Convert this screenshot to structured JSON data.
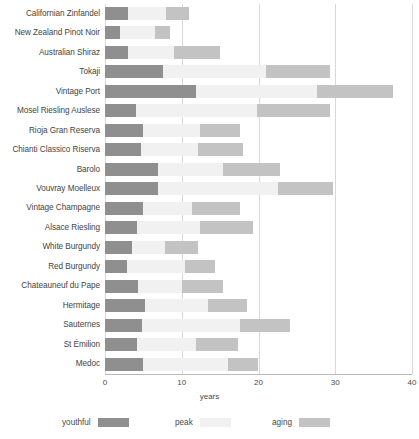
{
  "chart_data": {
    "type": "bar",
    "subtype": "stacked-horizontal",
    "title": "",
    "xlabel": "years",
    "ylabel": "",
    "xlim": [
      0,
      40
    ],
    "xticks": [
      0,
      10,
      20,
      30,
      40
    ],
    "xtick_labels": [
      "0",
      "10",
      "20",
      "30",
      "40"
    ],
    "grid": true,
    "grid_axis": "x",
    "legend_position": "bottom",
    "categories": [
      "Californian Zinfandel",
      "New Zealand Pinot Noir",
      "Australian Shiraz",
      "Tokaji",
      "Vintage Port",
      "Mosel Riesling Auslese",
      "Rioja Gran Reserva",
      "Chianti Classico Riserva",
      "Barolo",
      "Vouvray Moelleux",
      "Vintage Champagne",
      "Alsace Riesling",
      "White Burgundy",
      "Red Burgundy",
      "Chateauneuf du Pape",
      "Hermitage",
      "Sauternes",
      "St Émilion",
      "Medoc"
    ],
    "series": [
      {
        "name": "youthful",
        "color": "#8f8f8f",
        "values": [
          3,
          2,
          3,
          7.5,
          11.8,
          4,
          5,
          4.7,
          6.9,
          6.9,
          5,
          4.2,
          3.5,
          2.9,
          4.3,
          5.2,
          4.8,
          4.2,
          5
        ]
      },
      {
        "name": "peak",
        "color": "#f1f1f1",
        "values": [
          5,
          4.5,
          6,
          13.5,
          15.8,
          15.8,
          7.4,
          7.4,
          8.5,
          15.6,
          6.3,
          8.2,
          4.3,
          7.5,
          5.7,
          8.2,
          12.8,
          7.6,
          11
        ]
      },
      {
        "name": "aging",
        "color": "#c3c3c3",
        "values": [
          3,
          2,
          6,
          8.3,
          9.9,
          9.5,
          5.2,
          5.9,
          7.4,
          7.2,
          6.3,
          6.9,
          4.3,
          3.9,
          5.4,
          5.1,
          6.5,
          5.5,
          4
        ]
      }
    ],
    "totals": [
      11,
      8.5,
      15,
      29.3,
      37.5,
      29.3,
      17.6,
      18,
      22.8,
      29.7,
      17.6,
      19.3,
      12.1,
      14.3,
      15.4,
      18.5,
      24.1,
      17.3,
      20
    ]
  },
  "axis": {
    "x_title": "years",
    "ticks": [
      "0",
      "10",
      "20",
      "30",
      "40"
    ]
  },
  "legend": {
    "items": [
      {
        "label": "youthful",
        "color": "#8f8f8f"
      },
      {
        "label": "peak",
        "color": "#f1f1f1"
      },
      {
        "label": "aging",
        "color": "#c3c3c3"
      }
    ]
  }
}
